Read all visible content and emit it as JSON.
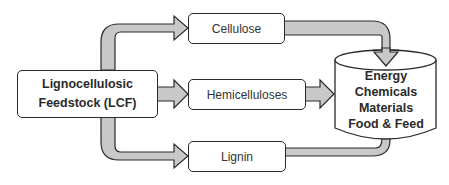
{
  "diagram": {
    "type": "flow",
    "source": {
      "line1": "Lignocellulosic",
      "line2": "Feedstock (LCF)"
    },
    "fractions": [
      {
        "label": "Cellulose"
      },
      {
        "label": "Hemicelluloses"
      },
      {
        "label": "Lignin"
      }
    ],
    "products": [
      "Energy",
      "Chemicals",
      "Materials",
      "Food & Feed"
    ],
    "colors": {
      "arrow_fill": "#c8c8c8",
      "stroke": "#2a2a2a",
      "box_fill": "#ffffff"
    }
  }
}
